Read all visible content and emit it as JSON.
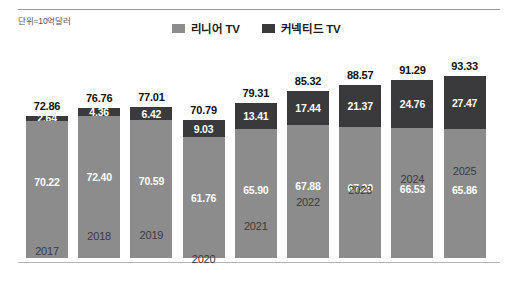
{
  "unit_note": "단위=10억달러",
  "legend": {
    "position": "top-center",
    "items": [
      {
        "label": "리니어 TV",
        "color": "#8c8c8c",
        "swatch_name": "legend-swatch-linear-tv"
      },
      {
        "label": "커넥티드 TV",
        "color": "#3a3a3c",
        "swatch_name": "legend-swatch-connected-tv"
      }
    ]
  },
  "chart_data": {
    "type": "bar",
    "stacked": true,
    "title": "",
    "subtitle": "",
    "xlabel": "",
    "ylabel": "",
    "unit": "단위=10억달러",
    "grid": false,
    "legend_position": "top-center",
    "ylim": [
      0,
      100
    ],
    "categories": [
      "2017",
      "2018",
      "2019",
      "2020",
      "2021",
      "2022",
      "2023",
      "2024",
      "2025"
    ],
    "series": [
      {
        "name": "리니어 TV",
        "color": "#8c8c8c",
        "values": [
          70.22,
          72.4,
          70.59,
          61.76,
          65.9,
          67.88,
          67.2,
          66.53,
          65.86
        ]
      },
      {
        "name": "커넥티드 TV",
        "color": "#3a3a3c",
        "values": [
          2.64,
          4.36,
          6.42,
          9.03,
          13.41,
          17.44,
          21.37,
          24.76,
          27.47
        ]
      }
    ],
    "totals": [
      72.86,
      76.76,
      77.01,
      70.79,
      79.31,
      85.32,
      88.57,
      91.29,
      93.33
    ]
  }
}
